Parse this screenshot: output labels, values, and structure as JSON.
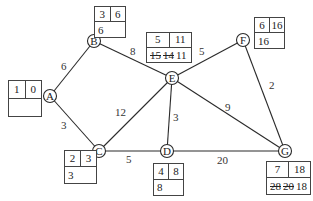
{
  "diagram": {
    "type": "network-critical-path",
    "nodes": [
      {
        "id": "A",
        "label": "A",
        "x": 50,
        "y": 96
      },
      {
        "id": "B",
        "label": "B",
        "x": 94,
        "y": 41
      },
      {
        "id": "C",
        "label": "C",
        "x": 99,
        "y": 151
      },
      {
        "id": "D",
        "label": "D",
        "x": 167,
        "y": 151
      },
      {
        "id": "E",
        "label": "E",
        "x": 172,
        "y": 78
      },
      {
        "id": "F",
        "label": "F",
        "x": 243,
        "y": 40
      },
      {
        "id": "G",
        "label": "G",
        "x": 285,
        "y": 151
      }
    ],
    "edges": [
      {
        "from": "A",
        "to": "B",
        "weight": "6"
      },
      {
        "from": "A",
        "to": "C",
        "weight": "3"
      },
      {
        "from": "B",
        "to": "E",
        "weight": "8"
      },
      {
        "from": "C",
        "to": "E",
        "weight": "12"
      },
      {
        "from": "C",
        "to": "D",
        "weight": "5"
      },
      {
        "from": "E",
        "to": "D",
        "weight": "3"
      },
      {
        "from": "E",
        "to": "F",
        "weight": "5"
      },
      {
        "from": "E",
        "to": "G",
        "weight": "9"
      },
      {
        "from": "F",
        "to": "G",
        "weight": "2"
      },
      {
        "from": "D",
        "to": "G",
        "weight": "20"
      }
    ],
    "boxes": {
      "A": {
        "order": "1",
        "final": "0",
        "working": []
      },
      "B": {
        "order": "3",
        "final": "6",
        "working": [
          "6"
        ],
        "crossed": []
      },
      "C": {
        "order": "2",
        "final": "3",
        "working": [
          "3"
        ],
        "crossed": []
      },
      "D": {
        "order": "4",
        "final": "8",
        "working": [
          "8"
        ],
        "crossed": []
      },
      "E": {
        "order": "5",
        "final": "11",
        "working": [
          "11"
        ],
        "crossed": [
          "15",
          "14"
        ]
      },
      "F": {
        "order": "6",
        "final": "16",
        "working": [
          "16"
        ],
        "crossed": []
      },
      "G": {
        "order": "7",
        "final": "18",
        "working": [
          "18"
        ],
        "crossed": [
          "28",
          "20"
        ]
      }
    }
  }
}
